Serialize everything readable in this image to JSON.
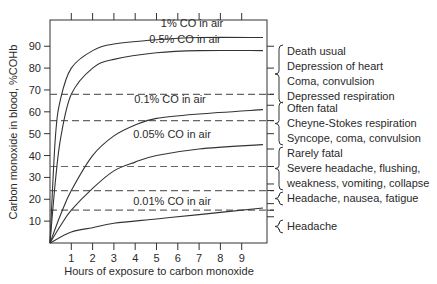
{
  "chart_data": {
    "type": "line",
    "title": "",
    "xlabel": "Hours of exposure to carbon monoxide",
    "ylabel": "Carbon monoxide in blood, %COHb",
    "xlim": [
      0,
      10
    ],
    "ylim": [
      0,
      100
    ],
    "x_ticks": [
      1,
      2,
      3,
      4,
      5,
      6,
      7,
      8,
      9
    ],
    "y_ticks": [
      10,
      20,
      30,
      40,
      50,
      60,
      70,
      80,
      90
    ],
    "grid": false,
    "legend": "inline labels",
    "series": [
      {
        "name": "1% CO in air",
        "x": [
          0,
          0.25,
          0.5,
          1,
          2,
          3,
          5,
          7,
          10
        ],
        "values": [
          0,
          48,
          66,
          80,
          88,
          91,
          93,
          94,
          94
        ]
      },
      {
        "name": "0.5% CO in air",
        "x": [
          0,
          0.25,
          0.5,
          1,
          2,
          3,
          5,
          7,
          10
        ],
        "values": [
          0,
          28,
          48,
          68,
          80,
          84,
          87,
          88,
          88
        ]
      },
      {
        "name": "0.1% CO in air",
        "x": [
          0,
          0.5,
          1,
          2,
          3,
          4,
          5,
          7,
          10
        ],
        "values": [
          0,
          13,
          24,
          40,
          49,
          54,
          57,
          59,
          61
        ]
      },
      {
        "name": "0.05% CO in air",
        "x": [
          0,
          0.5,
          1,
          2,
          3,
          4,
          5,
          7,
          10
        ],
        "values": [
          0,
          8,
          15,
          25,
          33,
          37,
          40,
          43,
          45
        ]
      },
      {
        "name": "0.01% CO in air",
        "x": [
          0,
          1,
          2,
          3,
          5,
          7,
          10
        ],
        "values": [
          0,
          5,
          7,
          9,
          11,
          13,
          16
        ]
      }
    ],
    "threshold_lines": [
      {
        "y": 68,
        "style": "dashed"
      },
      {
        "y": 56,
        "style": "dashed"
      },
      {
        "y": 35,
        "style": "dashed"
      },
      {
        "y": 24,
        "style": "dashed"
      },
      {
        "y": 15,
        "style": "dashed"
      }
    ],
    "annotations": [
      {
        "range": [
          68,
          90
        ],
        "lines": [
          "Death usual",
          "Depression of heart",
          "Coma, convulsion",
          "Depressed respiration"
        ]
      },
      {
        "range": [
          50,
          63
        ],
        "lines": [
          "Often fatal",
          "Cheyne-Stokes respiration",
          "Syncope, coma, convulsion"
        ]
      },
      {
        "range": [
          27,
          43
        ],
        "lines": [
          "Rarely fatal",
          "Severe headache, flushing,",
          "weakness, vomiting, collapse"
        ]
      },
      {
        "range": [
          21,
          27
        ],
        "lines": [
          "Headache, nausea, fatigue"
        ]
      },
      {
        "range": [
          12,
          18
        ],
        "lines": [
          "Headache"
        ]
      }
    ]
  }
}
